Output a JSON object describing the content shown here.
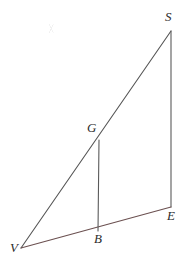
{
  "figure": {
    "background_color": "#ffffff",
    "width": 187,
    "height": 267,
    "stroke_color": "#555555",
    "base_stroke_color": "#6b5050",
    "label_color": "#2b2b2b",
    "label_style": "serif-italic"
  },
  "points": {
    "V": {
      "label": "V",
      "x": 21,
      "y": 248,
      "label_x": 10,
      "label_y": 241
    },
    "S": {
      "label": "S",
      "x": 171,
      "y": 31,
      "label_x": 165,
      "label_y": 10
    },
    "E": {
      "label": "E",
      "x": 171,
      "y": 207,
      "label_x": 167,
      "label_y": 209
    },
    "B": {
      "label": "B",
      "x": 98,
      "y": 231,
      "label_x": 94,
      "label_y": 232
    },
    "G": {
      "label": "G",
      "x": 99,
      "y": 140,
      "label_x": 87,
      "label_y": 121
    }
  },
  "segments": [
    {
      "name": "segment-VS",
      "from": "V",
      "to": "S",
      "color": "#555555",
      "width": 1.1
    },
    {
      "name": "segment-SE",
      "from": "S",
      "to": "E",
      "color": "#5a5a5a",
      "width": 1.1
    },
    {
      "name": "segment-VE",
      "from": "V",
      "to": "E",
      "color": "#6b5050",
      "width": 1.1
    },
    {
      "name": "segment-GB",
      "from": "G",
      "to": "B",
      "color": "#5a5a5a",
      "width": 1.1
    }
  ],
  "labels": {
    "V": "V",
    "S": "S",
    "E": "E",
    "B": "B",
    "G": "G"
  }
}
